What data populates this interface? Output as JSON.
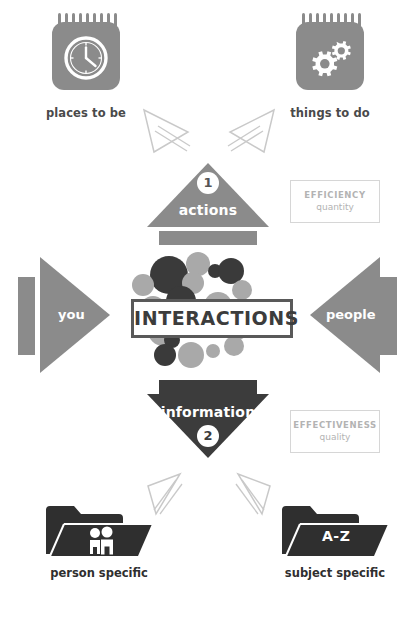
{
  "diagram": {
    "title": "INTERACTIONS",
    "top_left": {
      "icon": "notepad-clock-icon",
      "label": "places to be"
    },
    "top_right": {
      "icon": "notepad-gears-icon",
      "label": "things to do"
    },
    "top_triangle": {
      "label": "actions",
      "number": "1"
    },
    "bottom_triangle": {
      "label": "information",
      "number": "2"
    },
    "left_arrow": {
      "label": "you"
    },
    "right_arrow": {
      "label": "people"
    },
    "metric_top": {
      "line1": "EFFICIENCY",
      "line2": "quantity"
    },
    "metric_bottom": {
      "line1": "EFFECTIVENESS",
      "line2": "quality"
    },
    "bottom_left": {
      "icon": "folder-people-icon",
      "label": "person specific"
    },
    "bottom_right": {
      "icon": "folder-az-icon",
      "badge": "A-Z",
      "label": "subject specific"
    },
    "colors": {
      "gray": "#8b8b8b",
      "dark": "#3c3c3c",
      "bubble_dark": "#3a3a3a",
      "bubble_mid": "#6f6f6f",
      "bubble_light": "#a9a9a9",
      "outline": "#c9c9c9",
      "text_dark": "#2f2f2f",
      "metric_text": "#b3b3b3"
    }
  }
}
